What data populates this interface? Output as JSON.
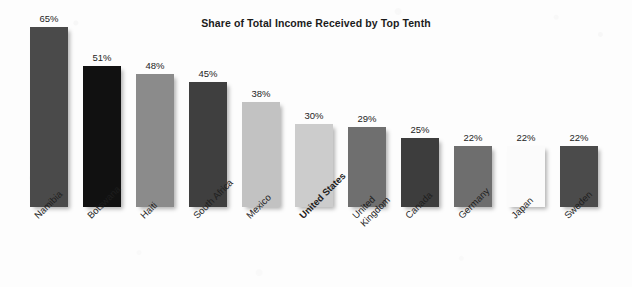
{
  "chart_data": {
    "type": "bar",
    "title": "Share of Total Income Received by Top Tenth",
    "xlabel": "",
    "ylabel": "",
    "ylim": [
      0,
      65
    ],
    "grid": false,
    "legend": "none",
    "value_suffix": "%",
    "categories": [
      "Namibia",
      "Botswana",
      "Haiti",
      "South Africa",
      "Mexico",
      "United States",
      "United\nKingdom",
      "Canada",
      "Germany",
      "Japan",
      "Sweden"
    ],
    "values": [
      65,
      51,
      48,
      45,
      38,
      30,
      29,
      25,
      22,
      22,
      22
    ],
    "value_labels": [
      "65%",
      "51%",
      "48%",
      "45%",
      "38%",
      "30%",
      "29%",
      "25%",
      "22%",
      "22%",
      "22%"
    ],
    "bar_colors": [
      "#4a4a4a",
      "#111111",
      "#8b8b8b",
      "#3f3f3f",
      "#c2c2c2",
      "#cccccc",
      "#6f6f6f",
      "#3d3d3d",
      "#6e6e6e",
      "#fbfbfb",
      "#4b4b4b"
    ],
    "highlighted_category": "United States",
    "annotations": []
  },
  "colors": {
    "background": "#fdfdfd",
    "title_text": "#1b1b1b",
    "label_text": "#1e1e1e",
    "value_text": "#242424"
  }
}
